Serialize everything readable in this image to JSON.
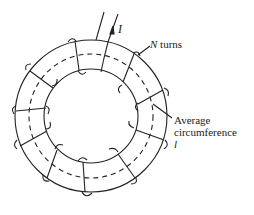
{
  "diagram": {
    "type": "toroidal-coil",
    "labels": {
      "current": "I",
      "turns_var": "N",
      "turns_text": " turns",
      "avg_line1": "Average",
      "avg_line2": "circumference",
      "avg_var": "l"
    },
    "colors": {
      "ink": "#222222",
      "background": "#ffffff"
    }
  }
}
